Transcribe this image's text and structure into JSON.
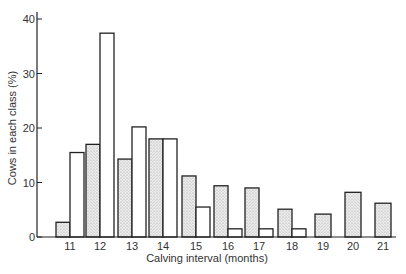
{
  "chart_data": {
    "type": "bar",
    "title": "",
    "xlabel": "Calving interval (months)",
    "ylabel": "Cows in each class (%)",
    "ylim": [
      0,
      40
    ],
    "yticks": [
      0,
      10,
      20,
      30,
      40
    ],
    "grid": false,
    "legend": null,
    "categories": [
      "11",
      "12",
      "13",
      "14",
      "15",
      "16",
      "17",
      "18",
      "19",
      "20",
      "21"
    ],
    "series": [
      {
        "name": "stippled (first half of interval)",
        "style": "stippled",
        "values": [
          2.7,
          17.0,
          14.3,
          18.0,
          11.2,
          9.4,
          9.0,
          5.1,
          4.2,
          8.2,
          6.2
        ]
      },
      {
        "name": "open (second half of interval)",
        "style": "open",
        "values": [
          15.5,
          37.4,
          20.2,
          18.0,
          5.5,
          1.5,
          1.5,
          1.5,
          0,
          0,
          0
        ]
      }
    ]
  },
  "colors": {
    "stroke": "#222222",
    "stipple_fill": "#e6e6e6",
    "open_fill": "#ffffff",
    "text": "#333333"
  }
}
